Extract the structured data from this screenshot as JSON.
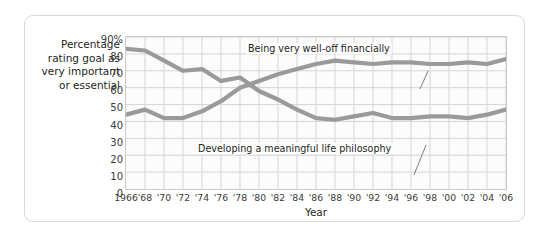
{
  "axis": {
    "y_title": "Percentage rating goal as very important or essential",
    "x_title": "Year"
  },
  "annotations": {
    "financial": "Being very well-off financially",
    "philosophy": "Developing a meaningful life philosophy"
  },
  "colors": {
    "line": "#9a9a9a",
    "grid": "#d5d5d5",
    "plot_border": "#c9c9c9",
    "frame": "#d8d8d8",
    "text": "#231f20",
    "plot_bg": "#fcfcfc"
  },
  "chart_data": {
    "type": "line",
    "title": "",
    "xlabel": "Year",
    "ylabel": "Percentage rating goal as very important or essential",
    "xlim": [
      1966,
      2006
    ],
    "ylim": [
      0,
      90
    ],
    "yticks": [
      0,
      10,
      20,
      30,
      40,
      50,
      60,
      70,
      80,
      90
    ],
    "ytick_labels": [
      "0",
      "10",
      "20",
      "30",
      "40",
      "50",
      "60",
      "70",
      "80",
      "90%"
    ],
    "xticks": [
      1966,
      1968,
      1970,
      1972,
      1974,
      1976,
      1978,
      1980,
      1982,
      1984,
      1986,
      1988,
      1990,
      1992,
      1994,
      1996,
      1998,
      2000,
      2002,
      2004,
      2006
    ],
    "xtick_labels": [
      "1966",
      "'68",
      "'70",
      "'72",
      "'74",
      "'76",
      "'78",
      "'80",
      "'82",
      "'84",
      "'86",
      "'88",
      "'90",
      "'92",
      "'94",
      "'96",
      "'98",
      "'00",
      "'02",
      "'04",
      "'06"
    ],
    "grid": true,
    "legend": "annotated-inline",
    "x": [
      1966,
      1968,
      1970,
      1972,
      1974,
      1976,
      1978,
      1980,
      1982,
      1984,
      1986,
      1988,
      1990,
      1992,
      1994,
      1996,
      1998,
      2000,
      2002,
      2004,
      2006
    ],
    "series": [
      {
        "name": "Developing a meaningful life philosophy",
        "values": [
          83,
          82,
          76,
          70,
          71,
          64,
          66,
          58,
          53,
          47,
          42,
          41,
          43,
          45,
          42,
          42,
          43,
          43,
          42,
          44,
          47
        ]
      },
      {
        "name": "Being very well-off financially",
        "values": [
          44,
          47,
          42,
          42,
          46,
          52,
          60,
          64,
          68,
          71,
          74,
          76,
          75,
          74,
          75,
          75,
          74,
          74,
          75,
          74,
          77
        ]
      }
    ]
  }
}
